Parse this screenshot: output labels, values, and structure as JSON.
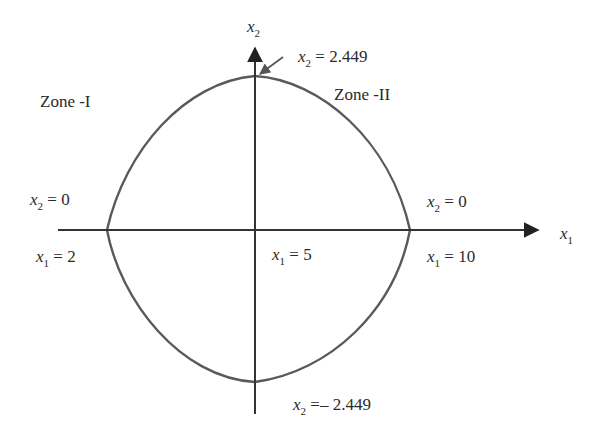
{
  "diagram": {
    "type": "feasible-region-plot",
    "axes": {
      "x": {
        "var": "x",
        "sub": "1"
      },
      "y": {
        "var": "x",
        "sub": "2"
      }
    },
    "zones": [
      {
        "label": "Zone -I"
      },
      {
        "label": "Zone -II"
      }
    ],
    "annotations": {
      "top": {
        "var": "x",
        "sub": "2",
        "rel": " = ",
        "value": "2.449"
      },
      "bottom": {
        "var": "x",
        "sub": "2",
        "rel": " =– ",
        "value": "2.449"
      },
      "left_upper": {
        "var": "x",
        "sub": "2",
        "rel": " = ",
        "value": "0"
      },
      "left_lower": {
        "var": "x",
        "sub": "1",
        "rel": " = ",
        "value": "2"
      },
      "center": {
        "var": "x",
        "sub": "1",
        "rel": " = ",
        "value": "5"
      },
      "right_upper": {
        "var": "x",
        "sub": "2",
        "rel": " = ",
        "value": "0"
      },
      "right_lower": {
        "var": "x",
        "sub": "1",
        "rel": " = ",
        "value": "10"
      }
    },
    "key_points": {
      "x1_left": 2,
      "x1_center": 5,
      "x1_right": 10,
      "x2_top": 2.449,
      "x2_bottom": -2.449
    },
    "colors": {
      "axis": "#333333",
      "curve": "#5a5a5a",
      "text": "#2a2a2a"
    }
  }
}
